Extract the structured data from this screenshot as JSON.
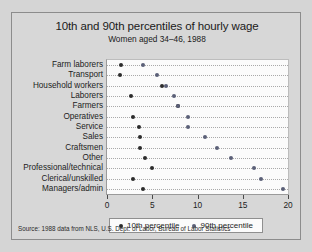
{
  "chart_data": {
    "type": "scatter",
    "title": "10th and 90th percentiles of hourly wage",
    "subtitle": "Women aged 34–46, 1988",
    "xlabel": "",
    "ylabel": "",
    "xlim": [
      0,
      20
    ],
    "xticks": [
      0,
      5,
      10,
      15,
      20
    ],
    "xtick_labels": [
      "0",
      "5",
      "10",
      "15",
      "20"
    ],
    "grid": "horizontal-dotted",
    "legend_position": "bottom",
    "categories": [
      "Farm laborers",
      "Transport",
      "Household workers",
      "Laborers",
      "Farmers",
      "Operatives",
      "Service",
      "Sales",
      "Craftsmen",
      "Other",
      "Professional/technical",
      "Clerical/unskilled",
      "Managers/admin"
    ],
    "series": [
      {
        "name": "10th percentile",
        "color": "#2b2b2b",
        "values": [
          1.5,
          1.4,
          6.1,
          2.7,
          7.8,
          2.9,
          3.5,
          3.6,
          3.6,
          4.2,
          5.0,
          2.9,
          4.0
        ]
      },
      {
        "name": "90th percentile",
        "color": "#5a5f77",
        "values": [
          4.0,
          5.5,
          6.5,
          7.4,
          7.8,
          8.9,
          8.9,
          10.8,
          12.2,
          13.7,
          16.2,
          17.0,
          19.4
        ]
      }
    ],
    "source_note": "Source:  1988 data from NLS, U.S. Dept. of Labor, Bureau of Labor Statistics"
  }
}
